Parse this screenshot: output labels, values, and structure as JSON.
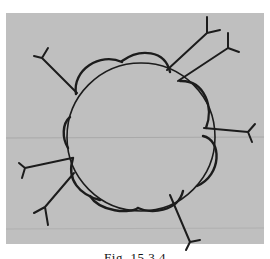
{
  "figure": {
    "background_color": "#bdbdbd",
    "ink_color": "#1c1c1c",
    "central_circle": {
      "cx": 141,
      "cy": 137,
      "r": 75
    },
    "lobe_count": 8,
    "branch_count": 8
  },
  "caption": {
    "text": "Fig. 15.3.4",
    "clipped": true
  }
}
